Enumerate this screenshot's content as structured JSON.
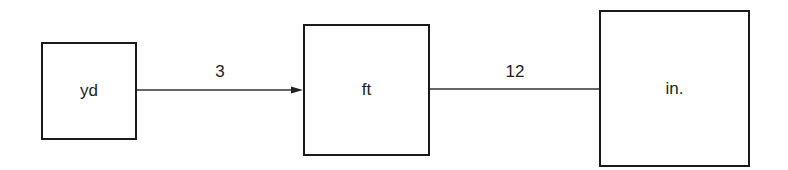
{
  "diagram": {
    "nodes": [
      {
        "id": "yd",
        "label": "yd"
      },
      {
        "id": "ft",
        "label": "ft"
      },
      {
        "id": "in",
        "label": "in."
      }
    ],
    "edges": [
      {
        "from": "yd",
        "to": "ft",
        "label": "3",
        "arrow": true
      },
      {
        "from": "ft",
        "to": "in",
        "label": "12",
        "arrow": false
      }
    ]
  }
}
